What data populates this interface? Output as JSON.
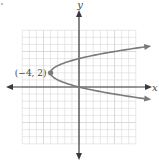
{
  "chart_data": {
    "type": "line",
    "title": "",
    "xlabel": "x",
    "ylabel": "y",
    "equation": "x = (y - 2)^2 - 4",
    "grid": true,
    "xlim": [
      -8,
      8
    ],
    "ylim": [
      -8,
      8
    ],
    "annotations": [
      {
        "label": "(−4, 2)",
        "x": -4,
        "y": 2,
        "marker": "dot"
      }
    ],
    "series": [
      {
        "name": "parabola",
        "points": [
          {
            "x": 9.6,
            "y": 5.7
          },
          {
            "x": 5,
            "y": 5
          },
          {
            "x": 0,
            "y": 4
          },
          {
            "x": -3,
            "y": 3
          },
          {
            "x": -4,
            "y": 2
          },
          {
            "x": -3,
            "y": 1
          },
          {
            "x": 0,
            "y": 0
          },
          {
            "x": 5,
            "y": -1
          },
          {
            "x": 9.6,
            "y": -1.7
          }
        ]
      }
    ]
  },
  "labels": {
    "x_axis": "x",
    "y_axis": "y",
    "vertex": "(−4, 2)"
  },
  "colors": {
    "grid": "#d6d6d6",
    "axis": "#3a3a3a",
    "curve": "#7a7a7a",
    "text": "#444444"
  }
}
